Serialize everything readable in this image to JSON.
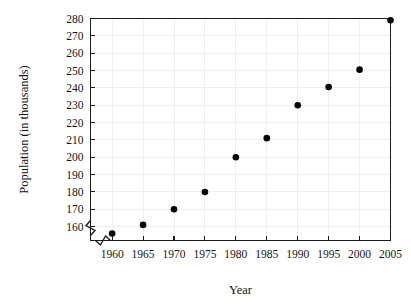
{
  "chart_data": {
    "type": "scatter",
    "title": "",
    "xlabel": "Year",
    "ylabel": "Population (in thousands)",
    "x": [
      1960,
      1965,
      1970,
      1975,
      1980,
      1985,
      1990,
      1995,
      2000,
      2005
    ],
    "values": [
      156,
      161,
      170,
      180,
      200,
      211,
      230,
      240.5,
      250.5,
      279
    ],
    "xticks": [
      "1960",
      "1965",
      "1970",
      "1975",
      "1980",
      "1985",
      "1990",
      "1995",
      "2000",
      "2005"
    ],
    "yticks": [
      "160",
      "170",
      "180",
      "190",
      "200",
      "210",
      "220",
      "230",
      "240",
      "250",
      "260",
      "270",
      "280"
    ],
    "xlim": [
      1956.5,
      2005
    ],
    "ylim": [
      152,
      280
    ],
    "grid": true,
    "legend": null,
    "axis_break": {
      "axis": "both",
      "note": "zigzag break near origin below 160 on y-axis and before 1960 on x-axis"
    },
    "colors": {
      "point": "#050505",
      "grid": "#eeeeee",
      "axis": "#1c1c1c",
      "background": "#ffffff"
    }
  }
}
